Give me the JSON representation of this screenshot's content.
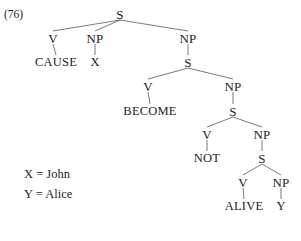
{
  "figure": {
    "example_number": "(76)",
    "type": "syntax-tree",
    "line_color": "#6b6b6b",
    "text_color": "#1c1c1c",
    "background": "#ffffff"
  },
  "tree": {
    "nodes": [
      {
        "id": "s-root",
        "label": "S",
        "x": 120,
        "y": 14,
        "kind": "nonterminal"
      },
      {
        "id": "v-1",
        "label": "V",
        "x": 53,
        "y": 38,
        "kind": "nonterminal"
      },
      {
        "id": "np-1",
        "label": "NP",
        "x": 95,
        "y": 38,
        "kind": "nonterminal"
      },
      {
        "id": "np-2",
        "label": "NP",
        "x": 188,
        "y": 38,
        "kind": "nonterminal"
      },
      {
        "id": "cause",
        "label": "CAUSE",
        "x": 56,
        "y": 62,
        "kind": "terminal"
      },
      {
        "id": "x-arg",
        "label": "X",
        "x": 95,
        "y": 62,
        "kind": "terminal"
      },
      {
        "id": "s-2",
        "label": "S",
        "x": 188,
        "y": 62,
        "kind": "nonterminal"
      },
      {
        "id": "v-2",
        "label": "V",
        "x": 148,
        "y": 86,
        "kind": "nonterminal"
      },
      {
        "id": "np-3",
        "label": "NP",
        "x": 233,
        "y": 86,
        "kind": "nonterminal"
      },
      {
        "id": "become",
        "label": "BECOME",
        "x": 150,
        "y": 111,
        "kind": "terminal"
      },
      {
        "id": "s-3",
        "label": "S",
        "x": 233,
        "y": 111,
        "kind": "nonterminal"
      },
      {
        "id": "v-3",
        "label": "V",
        "x": 207,
        "y": 134,
        "kind": "nonterminal"
      },
      {
        "id": "np-4",
        "label": "NP",
        "x": 262,
        "y": 134,
        "kind": "nonterminal"
      },
      {
        "id": "not",
        "label": "NOT",
        "x": 207,
        "y": 158,
        "kind": "terminal"
      },
      {
        "id": "s-4",
        "label": "S",
        "x": 262,
        "y": 158,
        "kind": "nonterminal"
      },
      {
        "id": "v-4",
        "label": "V",
        "x": 243,
        "y": 182,
        "kind": "nonterminal"
      },
      {
        "id": "np-5",
        "label": "NP",
        "x": 281,
        "y": 182,
        "kind": "nonterminal"
      },
      {
        "id": "alive",
        "label": "ALIVE",
        "x": 244,
        "y": 206,
        "kind": "terminal"
      },
      {
        "id": "y-arg",
        "label": "Y",
        "x": 281,
        "y": 206,
        "kind": "terminal"
      }
    ],
    "edges": [
      {
        "from": "s-root",
        "to": "v-1"
      },
      {
        "from": "s-root",
        "to": "np-1"
      },
      {
        "from": "s-root",
        "to": "np-2"
      },
      {
        "from": "v-1",
        "to": "cause"
      },
      {
        "from": "np-1",
        "to": "x-arg"
      },
      {
        "from": "np-2",
        "to": "s-2"
      },
      {
        "from": "s-2",
        "to": "v-2"
      },
      {
        "from": "s-2",
        "to": "np-3"
      },
      {
        "from": "v-2",
        "to": "become"
      },
      {
        "from": "np-3",
        "to": "s-3"
      },
      {
        "from": "s-3",
        "to": "v-3"
      },
      {
        "from": "s-3",
        "to": "np-4"
      },
      {
        "from": "v-3",
        "to": "not"
      },
      {
        "from": "np-4",
        "to": "s-4"
      },
      {
        "from": "s-4",
        "to": "v-4"
      },
      {
        "from": "s-4",
        "to": "np-5"
      },
      {
        "from": "v-4",
        "to": "alive"
      },
      {
        "from": "np-5",
        "to": "y-arg"
      }
    ]
  },
  "legend": {
    "lines": [
      "X = John",
      "Y = Alice"
    ]
  }
}
